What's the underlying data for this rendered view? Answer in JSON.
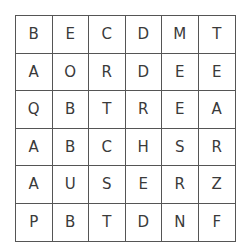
{
  "puzzle": {
    "type": "word-search",
    "rows": [
      [
        "B",
        "E",
        "C",
        "D",
        "M",
        "T"
      ],
      [
        "A",
        "O",
        "R",
        "D",
        "E",
        "E"
      ],
      [
        "Q",
        "B",
        "T",
        "R",
        "E",
        "A"
      ],
      [
        "A",
        "B",
        "C",
        "H",
        "S",
        "R"
      ],
      [
        "A",
        "U",
        "S",
        "E",
        "R",
        "Z"
      ],
      [
        "P",
        "B",
        "T",
        "D",
        "N",
        "F"
      ]
    ]
  }
}
